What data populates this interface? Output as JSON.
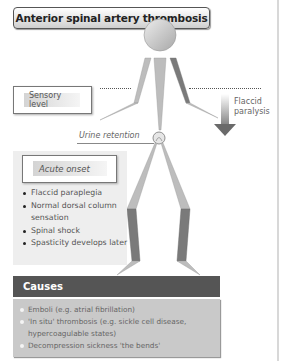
{
  "title": "Anterior spinal artery thrombosis",
  "figure": {
    "sensory_level_label": "Sensory level",
    "flaccid_paralysis_label": [
      "Flaccid",
      "paralysis"
    ],
    "urine_retention_label": "Urine retention"
  },
  "onset": {
    "heading": "Acute onset",
    "items": [
      "Flaccid paraplegia",
      "Normal dorsal column sensation",
      "Spinal shock",
      "Spasticity develops later"
    ]
  },
  "causes": {
    "heading": "Causes",
    "items": [
      "Emboli (e.g. atrial fibrillation)",
      "'In situ' thrombosis (e.g. sickle cell disease, hypercoagulable states)",
      "Decompression sickness 'the bends'"
    ]
  },
  "colors": {
    "header_dark": "#555555",
    "causes_bg": "#c9c9c9",
    "panel_bg": "#eeeeee",
    "limb_light": "#bdbdbd",
    "limb_dark": "#7a7a7a"
  }
}
